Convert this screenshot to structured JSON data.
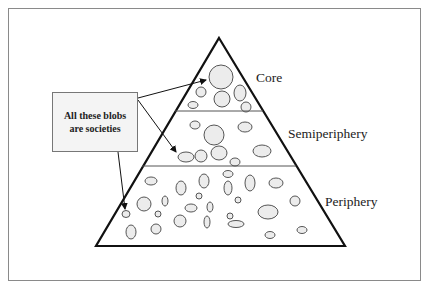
{
  "diagram": {
    "callout": {
      "line1": "All these blobs",
      "line2": "are societies"
    },
    "tiers": [
      {
        "name": "core",
        "label": "Core",
        "label_x": 250,
        "label_y": 79
      },
      {
        "name": "semiperiphery",
        "label": "Semiperiphery",
        "label_x": 287,
        "label_y": 133
      },
      {
        "name": "periphery",
        "label": "Periphery",
        "label_x": 325,
        "label_y": 196
      }
    ],
    "colors": {
      "outline": "#111111",
      "divider": "#555555",
      "blob_fill": "#ececec",
      "blob_stroke": "#555555",
      "frame": "#8a8a8a",
      "callout_fill": "#f4f4f4"
    }
  }
}
